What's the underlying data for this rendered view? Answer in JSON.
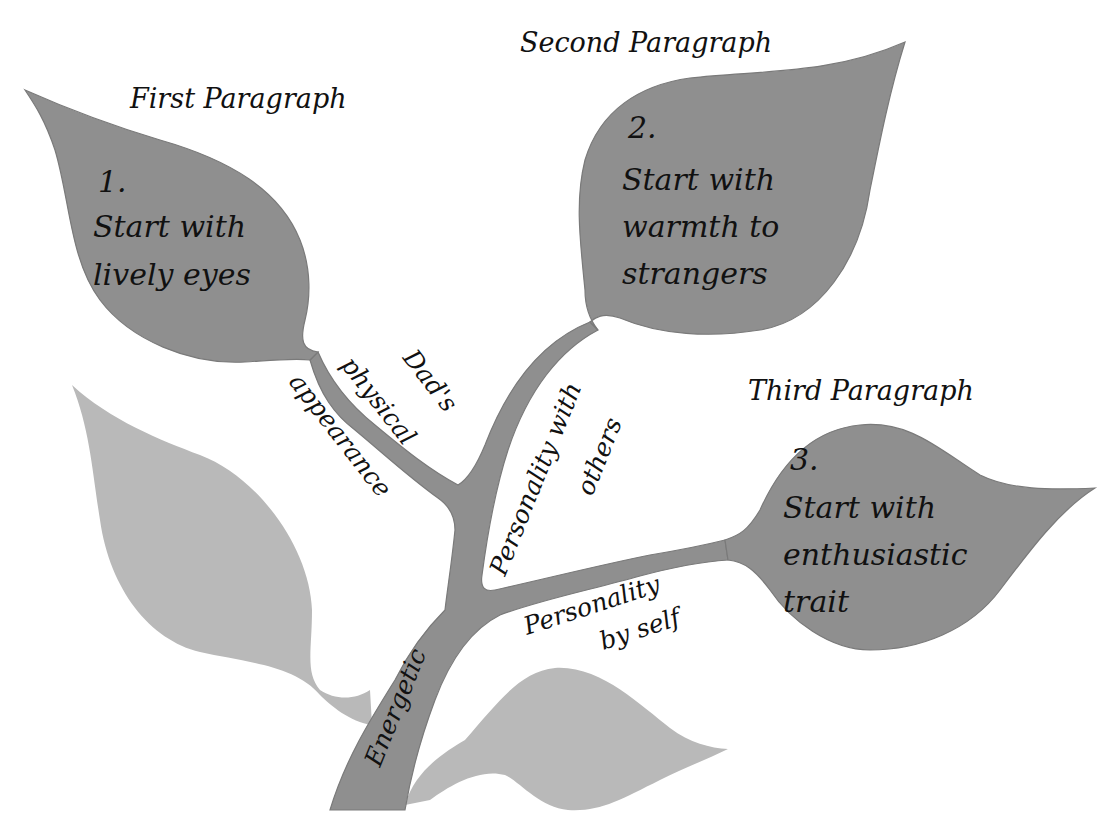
{
  "diagram": {
    "type": "idea-tree",
    "colors": {
      "leaf_dark": "#8f8f8f",
      "leaf_light": "#b9b9b9",
      "stroke": "#7a7a7a",
      "text": "#111111",
      "background": "#ffffff"
    },
    "headings": {
      "first": "First Paragraph",
      "second": "Second Paragraph",
      "third": "Third Paragraph"
    },
    "leaves": [
      {
        "number": "1.",
        "lines": [
          "Start with",
          "lively eyes"
        ]
      },
      {
        "number": "2.",
        "lines": [
          "Start with",
          "warmth to",
          "strangers"
        ]
      },
      {
        "number": "3.",
        "lines": [
          "Start with",
          "enthusiastic",
          "trait"
        ]
      }
    ],
    "branches": {
      "physical": [
        "Dad's",
        "physical",
        "appearance"
      ],
      "others": [
        "Personality with",
        "others"
      ],
      "self": [
        "Personality",
        "by self"
      ],
      "trunk": "Energetic"
    }
  }
}
